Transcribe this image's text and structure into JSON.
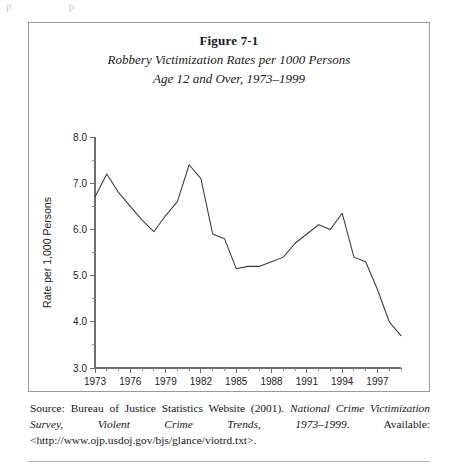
{
  "figure": {
    "label": "Figure 7-1",
    "subtitle_line1": "Robbery Victimization Rates per 1000 Persons",
    "subtitle_line2": "Age 12 and Over, 1973–1999"
  },
  "source": {
    "prefix": "Source: Bureau of Justice Statistics Website (2001). ",
    "italic1": "National Crime Victimization Survey, Violent Crime Trends, 1973–1999",
    "suffix": ". Available: <http://www.ojp.usdoj.gov/bjs/glance/viotrd.txt>."
  },
  "chart_data": {
    "type": "line",
    "title": "Robbery Victimization Rates per 1000 Persons Age 12 and Over, 1973–1999",
    "xlabel": "Year",
    "ylabel": "Rate per 1,000 Persons",
    "xlim": [
      1973,
      1999
    ],
    "ylim": [
      3.0,
      8.0
    ],
    "grid": false,
    "legend": "none",
    "y_ticks": [
      "3.0",
      "4.0",
      "5.0",
      "6.0",
      "7.0",
      "8.0"
    ],
    "y_tick_values": [
      3.0,
      4.0,
      5.0,
      6.0,
      7.0,
      8.0
    ],
    "y_minor_tick_interval": 0.5,
    "x_ticks": [
      "1973",
      "1976",
      "1979",
      "1982",
      "1985",
      "1988",
      "1991",
      "1994",
      "1997"
    ],
    "x_tick_values": [
      1973,
      1976,
      1979,
      1982,
      1985,
      1988,
      1991,
      1994,
      1997
    ],
    "x_minor_tick_interval": 1,
    "x": [
      1973,
      1974,
      1975,
      1976,
      1977,
      1978,
      1979,
      1980,
      1981,
      1982,
      1983,
      1984,
      1985,
      1986,
      1987,
      1988,
      1989,
      1990,
      1991,
      1992,
      1993,
      1994,
      1995,
      1996,
      1997,
      1998,
      1999
    ],
    "values": [
      6.7,
      7.2,
      6.8,
      6.5,
      6.2,
      5.95,
      6.3,
      6.6,
      7.4,
      7.1,
      5.9,
      5.8,
      5.15,
      5.2,
      5.2,
      5.3,
      5.4,
      5.7,
      5.9,
      6.1,
      6.0,
      6.35,
      5.4,
      5.3,
      4.7,
      4.0,
      3.7
    ],
    "line_color": "#3a3a3a"
  },
  "artifact": {
    "text": "p               p"
  }
}
